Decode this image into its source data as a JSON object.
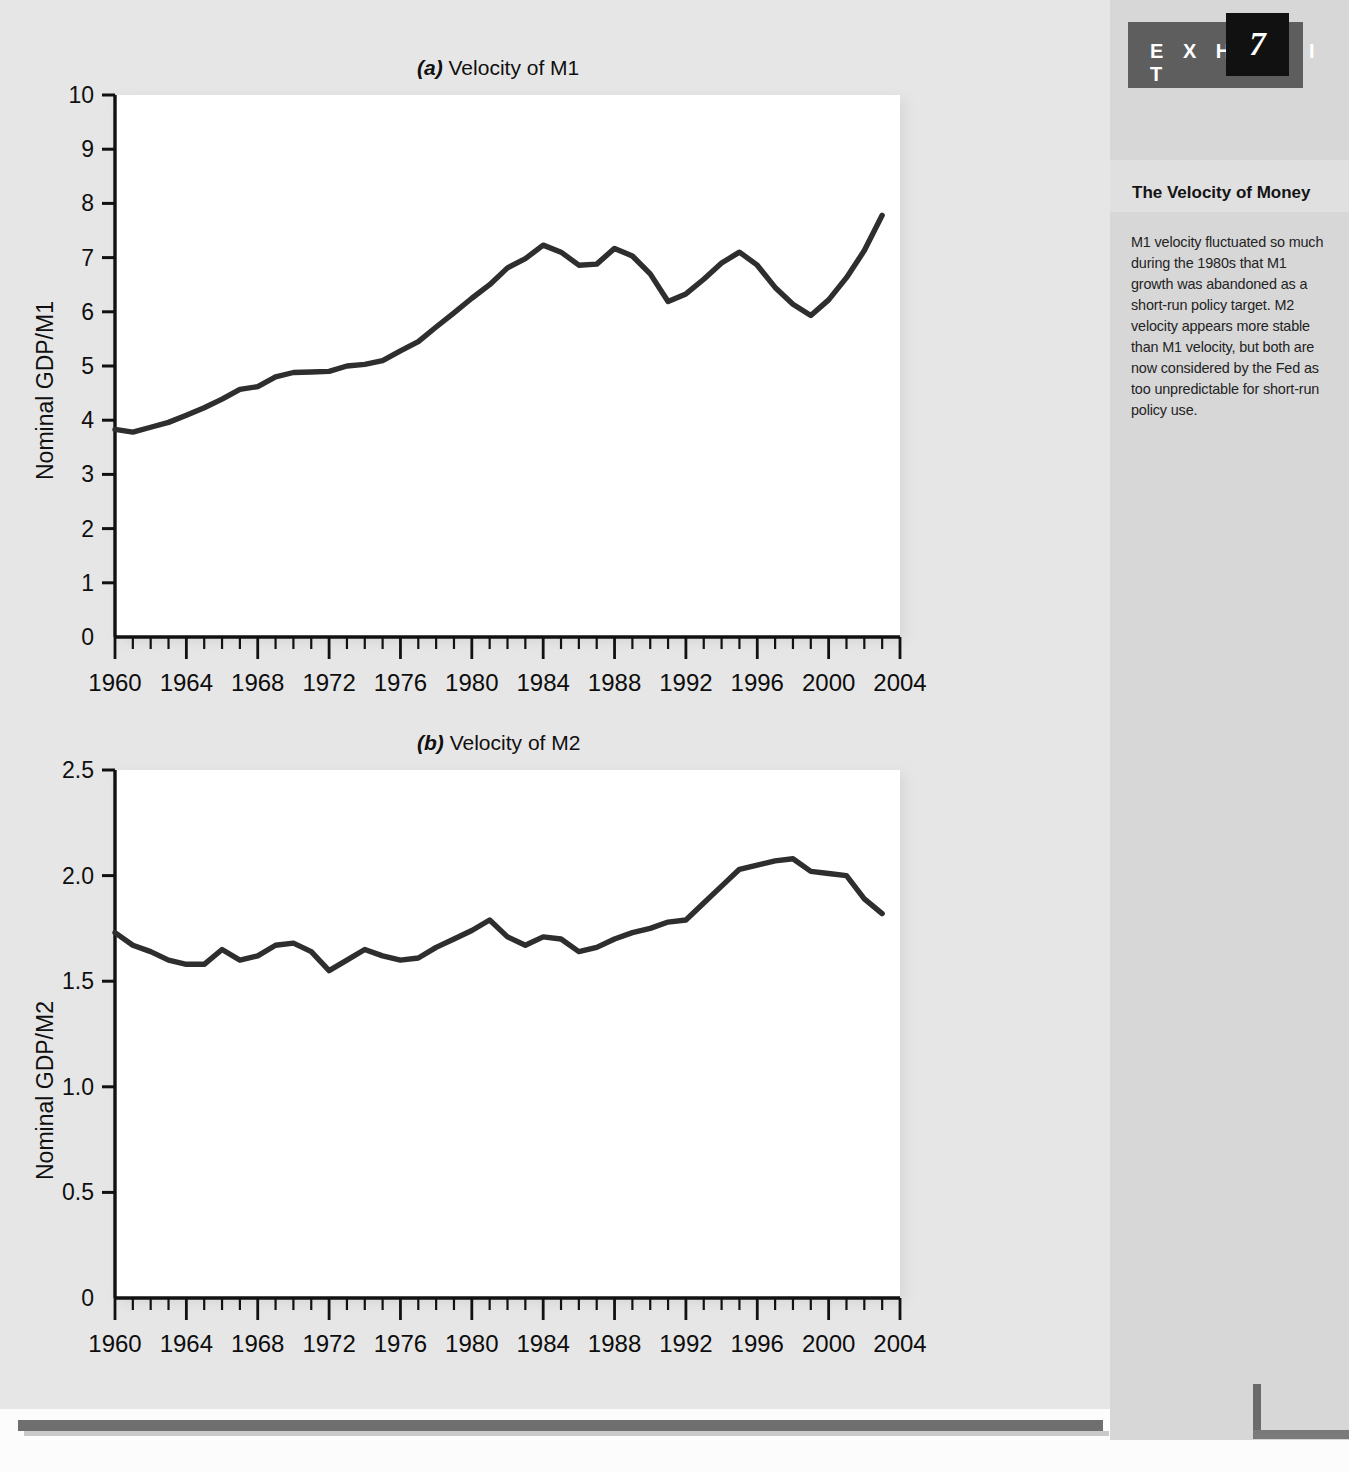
{
  "exhibit": {
    "label": "E X H I B I T",
    "number": "7"
  },
  "sidebar": {
    "heading": "The Velocity of Money",
    "body": "M1 velocity fluctuated so much during the 1980s that M1 growth was abandoned as a short-run policy target. M2 velocity appears more stable than M1 velocity, but both are now considered by the Fed as too unpredictable for short-run policy use."
  },
  "chart_data": [
    {
      "type": "line",
      "panel": "a",
      "title_prefix": "(a)",
      "title": "Velocity of M1",
      "xlabel": "",
      "ylabel": "Nominal GDP/M1",
      "xlim": [
        1960,
        2004
      ],
      "ylim": [
        0,
        10
      ],
      "ytick_labels": [
        "0",
        "1",
        "2",
        "3",
        "4",
        "5",
        "6",
        "7",
        "8",
        "9",
        "10"
      ],
      "ytick_values": [
        0,
        1,
        2,
        3,
        4,
        5,
        6,
        7,
        8,
        9,
        10
      ],
      "xtick_labels": [
        "1960",
        "1964",
        "1968",
        "1972",
        "1976",
        "1980",
        "1984",
        "1988",
        "1992",
        "1996",
        "2000",
        "2004"
      ],
      "xtick_values": [
        1960,
        1964,
        1968,
        1972,
        1976,
        1980,
        1984,
        1988,
        1992,
        1996,
        2000,
        2004
      ],
      "minor_tick_interval": 1,
      "grid": false,
      "legend": "none",
      "series": [
        {
          "name": "Velocity of M1",
          "color": "#2e2e2e",
          "x": [
            1960,
            1961,
            1962,
            1963,
            1964,
            1965,
            1966,
            1967,
            1968,
            1969,
            1970,
            1971,
            1972,
            1973,
            1974,
            1975,
            1976,
            1977,
            1978,
            1979,
            1980,
            1981,
            1982,
            1983,
            1984,
            1985,
            1986,
            1987,
            1988,
            1989,
            1990,
            1991,
            1992,
            1993,
            1994,
            1995,
            1996,
            1997,
            1998,
            1999,
            2000,
            2001,
            2002,
            2003
          ],
          "values": [
            3.83,
            3.78,
            3.87,
            3.96,
            4.09,
            4.23,
            4.39,
            4.57,
            4.62,
            4.8,
            4.88,
            4.89,
            4.9,
            5.0,
            5.03,
            5.1,
            5.28,
            5.45,
            5.72,
            5.98,
            6.25,
            6.5,
            6.81,
            6.98,
            7.23,
            7.1,
            6.86,
            6.88,
            7.17,
            7.03,
            6.7,
            6.19,
            6.33,
            6.6,
            6.9,
            7.1,
            6.86,
            6.45,
            6.14,
            5.93,
            6.22,
            6.63,
            7.13,
            7.78,
            8.35,
            8.67,
            8.95,
            8.74,
            8.66,
            8.72,
            8.7,
            8.6
          ]
        }
      ]
    },
    {
      "type": "line",
      "panel": "b",
      "title_prefix": "(b)",
      "title": "Velocity of M2",
      "xlabel": "",
      "ylabel": "Nominal GDP/M2",
      "xlim": [
        1960,
        2004
      ],
      "ylim": [
        0,
        2.5
      ],
      "ytick_labels": [
        "0",
        "0.5",
        "1.0",
        "1.5",
        "2.0",
        "2.5"
      ],
      "ytick_values": [
        0,
        0.5,
        1.0,
        1.5,
        2.0,
        2.5
      ],
      "xtick_labels": [
        "1960",
        "1964",
        "1968",
        "1972",
        "1976",
        "1980",
        "1984",
        "1988",
        "1992",
        "1996",
        "2000",
        "2004"
      ],
      "xtick_values": [
        1960,
        1964,
        1968,
        1972,
        1976,
        1980,
        1984,
        1988,
        1992,
        1996,
        2000,
        2004
      ],
      "minor_tick_interval": 1,
      "grid": false,
      "legend": "none",
      "series": [
        {
          "name": "Velocity of M2",
          "color": "#2e2e2e",
          "x": [
            1960,
            1961,
            1962,
            1963,
            1964,
            1965,
            1966,
            1967,
            1968,
            1969,
            1970,
            1971,
            1972,
            1973,
            1974,
            1975,
            1976,
            1977,
            1978,
            1979,
            1980,
            1981,
            1982,
            1983,
            1984,
            1985,
            1986,
            1987,
            1988,
            1989,
            1990,
            1991,
            1992,
            1993,
            1994,
            1995,
            1996,
            1997,
            1998,
            1999,
            2000,
            2001,
            2002,
            2003
          ],
          "values": [
            1.73,
            1.67,
            1.64,
            1.6,
            1.58,
            1.58,
            1.65,
            1.6,
            1.62,
            1.67,
            1.68,
            1.64,
            1.55,
            1.6,
            1.65,
            1.62,
            1.6,
            1.61,
            1.66,
            1.7,
            1.74,
            1.79,
            1.71,
            1.67,
            1.71,
            1.7,
            1.64,
            1.66,
            1.7,
            1.73,
            1.75,
            1.78,
            1.79,
            1.87,
            1.95,
            2.03,
            2.05,
            2.07,
            2.08,
            2.02,
            2.01,
            2.0,
            1.89,
            1.82
          ]
        }
      ]
    }
  ]
}
